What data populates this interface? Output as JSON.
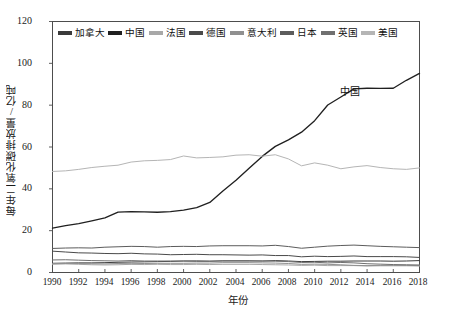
{
  "chart_data": {
    "type": "line",
    "title": "",
    "xlabel": "年份",
    "ylabel": "每年二氧化碳排放量/亿吨",
    "xlim": [
      1990,
      2018
    ],
    "ylim": [
      0,
      120
    ],
    "ytick_labels": [
      "0",
      "20",
      "40",
      "60",
      "80",
      "100",
      "120"
    ],
    "ytick_values": [
      0,
      20,
      40,
      60,
      80,
      100,
      120
    ],
    "xtick_labels": [
      "1990",
      "1992",
      "1994",
      "1996",
      "1998",
      "2000",
      "2002",
      "2004",
      "2006",
      "2008",
      "2010",
      "2012",
      "2014",
      "2016",
      "2018"
    ],
    "xtick_values": [
      1990,
      1992,
      1994,
      1996,
      1998,
      2000,
      2002,
      2004,
      2006,
      2008,
      2010,
      2012,
      2014,
      2016,
      2018
    ],
    "grid": false,
    "legend_position": "top-inside",
    "x": [
      1990,
      1991,
      1992,
      1993,
      1994,
      1995,
      1996,
      1997,
      1998,
      1999,
      2000,
      2001,
      2002,
      2003,
      2004,
      2005,
      2006,
      2007,
      2008,
      2009,
      2010,
      2011,
      2012,
      2013,
      2014,
      2015,
      2016,
      2017,
      2018
    ],
    "series": [
      {
        "name": "加拿大",
        "color": "#3a3a3a",
        "values": [
          4.4,
          4.5,
          4.6,
          4.6,
          4.7,
          4.9,
          5.0,
          5.1,
          5.2,
          5.3,
          5.5,
          5.4,
          5.4,
          5.6,
          5.6,
          5.6,
          5.5,
          5.7,
          5.5,
          5.2,
          5.3,
          5.4,
          5.4,
          5.5,
          5.5,
          5.5,
          5.4,
          5.5,
          5.7
        ]
      },
      {
        "name": "中国",
        "color": "#202020",
        "values": [
          21.2,
          22.4,
          23.4,
          24.7,
          26.1,
          28.9,
          29.1,
          29.0,
          28.8,
          29.1,
          29.8,
          31.0,
          33.5,
          39.0,
          44.1,
          49.9,
          55.5,
          60.3,
          63.4,
          67.1,
          72.6,
          80.1,
          83.9,
          87.8,
          88.1,
          88.0,
          88.1,
          91.9,
          95.2
        ]
      },
      {
        "name": "法国",
        "color": "#a8a8a8",
        "values": [
          3.9,
          4.1,
          3.9,
          3.7,
          3.6,
          3.7,
          3.9,
          3.8,
          3.9,
          3.8,
          3.8,
          3.9,
          3.8,
          3.9,
          3.9,
          3.9,
          3.8,
          3.7,
          3.6,
          3.4,
          3.5,
          3.3,
          3.3,
          3.3,
          3.1,
          3.2,
          3.2,
          3.2,
          3.1
        ]
      },
      {
        "name": "德国",
        "color": "#4a4a4a",
        "values": [
          10.2,
          9.8,
          9.4,
          9.3,
          9.1,
          9.0,
          9.2,
          8.9,
          8.8,
          8.5,
          8.6,
          8.7,
          8.5,
          8.5,
          8.4,
          8.3,
          8.4,
          8.1,
          8.1,
          7.5,
          7.8,
          7.6,
          7.7,
          7.9,
          7.6,
          7.6,
          7.6,
          7.5,
          7.2
        ]
      },
      {
        "name": "意大利",
        "color": "#909090",
        "values": [
          4.3,
          4.3,
          4.3,
          4.2,
          4.1,
          4.3,
          4.2,
          4.3,
          4.4,
          4.4,
          4.4,
          4.5,
          4.5,
          4.7,
          4.7,
          4.7,
          4.6,
          4.5,
          4.3,
          3.9,
          4.0,
          3.9,
          3.7,
          3.4,
          3.3,
          3.4,
          3.4,
          3.4,
          3.3
        ]
      },
      {
        "name": "日本",
        "color": "#5c5c5c",
        "values": [
          11.5,
          11.7,
          11.8,
          11.7,
          12.1,
          12.3,
          12.5,
          12.4,
          12.1,
          12.4,
          12.5,
          12.4,
          12.7,
          12.8,
          12.8,
          12.8,
          12.7,
          13.0,
          12.4,
          11.6,
          12.1,
          12.6,
          12.9,
          13.1,
          12.8,
          12.5,
          12.3,
          12.1,
          11.9
        ]
      },
      {
        "name": "英国",
        "color": "#707070",
        "values": [
          6.0,
          6.1,
          5.9,
          5.7,
          5.6,
          5.5,
          5.7,
          5.5,
          5.5,
          5.5,
          5.5,
          5.6,
          5.4,
          5.5,
          5.5,
          5.5,
          5.5,
          5.4,
          5.2,
          4.8,
          4.9,
          4.6,
          4.8,
          4.6,
          4.2,
          4.0,
          3.8,
          3.7,
          3.6
        ]
      },
      {
        "name": "美国",
        "color": "#b5b5b5",
        "values": [
          48.3,
          48.6,
          49.3,
          50.2,
          50.8,
          51.3,
          52.8,
          53.4,
          53.6,
          54.0,
          55.7,
          54.8,
          55.0,
          55.3,
          56.1,
          56.3,
          55.6,
          56.3,
          54.3,
          51.0,
          52.4,
          51.3,
          49.6,
          50.5,
          51.1,
          50.2,
          49.6,
          49.3,
          50.0
        ]
      }
    ],
    "annotations": [
      {
        "text": "中国",
        "x": 2013,
        "y": 88
      }
    ]
  },
  "legend": {
    "items": [
      {
        "label": "加拿大"
      },
      {
        "label": "中国"
      },
      {
        "label": "法国"
      },
      {
        "label": "德国"
      },
      {
        "label": "意大利"
      },
      {
        "label": "日本"
      },
      {
        "label": "英国"
      },
      {
        "label": "美国"
      }
    ]
  },
  "axes": {
    "y_title": "每年二氧化碳排放量/亿吨",
    "x_title": "年份",
    "y_ticks": [
      "120",
      "100",
      "80",
      "60",
      "40",
      "20",
      "0"
    ],
    "x_ticks": [
      "1990",
      "1992",
      "1994",
      "1996",
      "1998",
      "2000",
      "2002",
      "2004",
      "2006",
      "2008",
      "2010",
      "2012",
      "2014",
      "2016",
      "2018"
    ]
  },
  "colors": {
    "frame": "#4d4d4d",
    "text": "#1a1a1a",
    "background": "#ffffff"
  }
}
